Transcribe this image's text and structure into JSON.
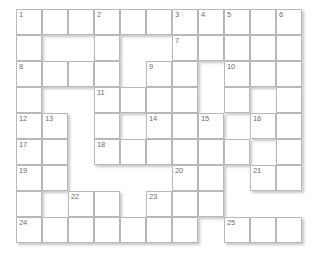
{
  "puzzle": {
    "title": "Crossword Grid",
    "columns": 11,
    "rows": 9,
    "cell_size_px": 26,
    "colors": {
      "cell_fill": "#ffffff",
      "cell_border": "#b9b9b9",
      "number_text": "#6d6d6d",
      "page_background": "#ffffff",
      "shadow": "rgba(130,130,130,0.45)"
    },
    "legend": {
      "open": "white playable square with border",
      "void": "blank area, no square drawn"
    },
    "clue_numbers": [
      1,
      2,
      3,
      4,
      5,
      6,
      7,
      8,
      9,
      10,
      11,
      12,
      13,
      14,
      15,
      16,
      17,
      18,
      19,
      20,
      21,
      22,
      23,
      24,
      25
    ],
    "grid": [
      [
        {
          "state": "open",
          "num": "1"
        },
        {
          "state": "open",
          "num": ""
        },
        {
          "state": "open",
          "num": ""
        },
        {
          "state": "open",
          "num": "2"
        },
        {
          "state": "open",
          "num": ""
        },
        {
          "state": "open",
          "num": ""
        },
        {
          "state": "open",
          "num": "3"
        },
        {
          "state": "open",
          "num": "4"
        },
        {
          "state": "open",
          "num": "5"
        },
        {
          "state": "open",
          "num": ""
        },
        {
          "state": "open",
          "num": "6"
        }
      ],
      [
        {
          "state": "open",
          "num": ""
        },
        {
          "state": "void",
          "num": ""
        },
        {
          "state": "void",
          "num": ""
        },
        {
          "state": "open",
          "num": ""
        },
        {
          "state": "void",
          "num": ""
        },
        {
          "state": "void",
          "num": ""
        },
        {
          "state": "open",
          "num": "7"
        },
        {
          "state": "open",
          "num": ""
        },
        {
          "state": "open",
          "num": ""
        },
        {
          "state": "open",
          "num": ""
        },
        {
          "state": "open",
          "num": ""
        }
      ],
      [
        {
          "state": "open",
          "num": "8"
        },
        {
          "state": "open",
          "num": ""
        },
        {
          "state": "open",
          "num": ""
        },
        {
          "state": "open",
          "num": ""
        },
        {
          "state": "void",
          "num": ""
        },
        {
          "state": "open",
          "num": "9"
        },
        {
          "state": "open",
          "num": ""
        },
        {
          "state": "void",
          "num": ""
        },
        {
          "state": "open",
          "num": "10"
        },
        {
          "state": "open",
          "num": ""
        },
        {
          "state": "open",
          "num": ""
        }
      ],
      [
        {
          "state": "open",
          "num": ""
        },
        {
          "state": "void",
          "num": ""
        },
        {
          "state": "void",
          "num": ""
        },
        {
          "state": "open",
          "num": "11"
        },
        {
          "state": "open",
          "num": ""
        },
        {
          "state": "open",
          "num": ""
        },
        {
          "state": "open",
          "num": ""
        },
        {
          "state": "void",
          "num": ""
        },
        {
          "state": "open",
          "num": ""
        },
        {
          "state": "void",
          "num": ""
        },
        {
          "state": "open",
          "num": ""
        }
      ],
      [
        {
          "state": "open",
          "num": "12"
        },
        {
          "state": "open",
          "num": "13"
        },
        {
          "state": "void",
          "num": ""
        },
        {
          "state": "open",
          "num": ""
        },
        {
          "state": "void",
          "num": ""
        },
        {
          "state": "open",
          "num": "14"
        },
        {
          "state": "open",
          "num": ""
        },
        {
          "state": "open",
          "num": "15"
        },
        {
          "state": "void",
          "num": ""
        },
        {
          "state": "open",
          "num": "16"
        },
        {
          "state": "open",
          "num": ""
        }
      ],
      [
        {
          "state": "open",
          "num": "17"
        },
        {
          "state": "open",
          "num": ""
        },
        {
          "state": "void",
          "num": ""
        },
        {
          "state": "open",
          "num": "18"
        },
        {
          "state": "open",
          "num": ""
        },
        {
          "state": "open",
          "num": ""
        },
        {
          "state": "open",
          "num": ""
        },
        {
          "state": "open",
          "num": ""
        },
        {
          "state": "open",
          "num": ""
        },
        {
          "state": "void",
          "num": ""
        },
        {
          "state": "open",
          "num": ""
        }
      ],
      [
        {
          "state": "open",
          "num": "19"
        },
        {
          "state": "open",
          "num": ""
        },
        {
          "state": "void",
          "num": ""
        },
        {
          "state": "void",
          "num": ""
        },
        {
          "state": "void",
          "num": ""
        },
        {
          "state": "void",
          "num": ""
        },
        {
          "state": "open",
          "num": "20"
        },
        {
          "state": "open",
          "num": ""
        },
        {
          "state": "void",
          "num": ""
        },
        {
          "state": "open",
          "num": "21"
        },
        {
          "state": "open",
          "num": ""
        }
      ],
      [
        {
          "state": "open",
          "num": ""
        },
        {
          "state": "void",
          "num": ""
        },
        {
          "state": "open",
          "num": "22"
        },
        {
          "state": "open",
          "num": ""
        },
        {
          "state": "void",
          "num": ""
        },
        {
          "state": "open",
          "num": "23"
        },
        {
          "state": "open",
          "num": ""
        },
        {
          "state": "open",
          "num": ""
        },
        {
          "state": "void",
          "num": ""
        },
        {
          "state": "void",
          "num": ""
        },
        {
          "state": "void",
          "num": ""
        }
      ],
      [
        {
          "state": "open",
          "num": "24"
        },
        {
          "state": "open",
          "num": ""
        },
        {
          "state": "open",
          "num": ""
        },
        {
          "state": "open",
          "num": ""
        },
        {
          "state": "open",
          "num": ""
        },
        {
          "state": "open",
          "num": ""
        },
        {
          "state": "open",
          "num": ""
        },
        {
          "state": "void",
          "num": ""
        },
        {
          "state": "open",
          "num": "25"
        },
        {
          "state": "open",
          "num": ""
        },
        {
          "state": "open",
          "num": ""
        }
      ]
    ]
  }
}
